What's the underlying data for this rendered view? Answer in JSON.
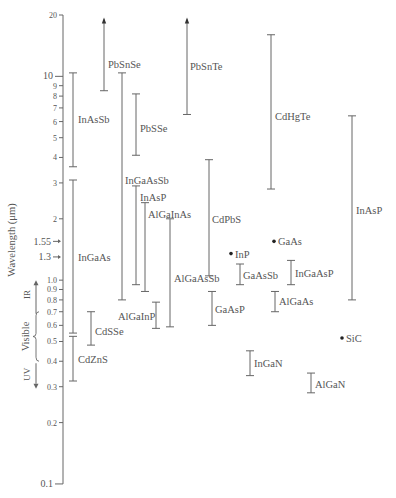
{
  "chart_data": {
    "type": "range",
    "title": "",
    "ylabel": "Wavelength (μm)",
    "yscale": "log",
    "ylim": [
      0.1,
      20
    ],
    "yticks": [
      {
        "v": 20,
        "label": "20",
        "big": false
      },
      {
        "v": 10,
        "label": "10",
        "big": true
      },
      {
        "v": 9,
        "label": "9"
      },
      {
        "v": 8,
        "label": "8"
      },
      {
        "v": 7,
        "label": "7"
      },
      {
        "v": 6,
        "label": "6"
      },
      {
        "v": 5,
        "label": "5"
      },
      {
        "v": 4,
        "label": "4"
      },
      {
        "v": 3,
        "label": "3"
      },
      {
        "v": 2,
        "label": "2"
      },
      {
        "v": 1.0,
        "label": "1.0"
      },
      {
        "v": 0.9,
        "label": "0.9"
      },
      {
        "v": 0.8,
        "label": "0.8"
      },
      {
        "v": 0.7,
        "label": "0.7"
      },
      {
        "v": 0.6,
        "label": "0.6"
      },
      {
        "v": 0.5,
        "label": "0.5"
      },
      {
        "v": 0.4,
        "label": "0.4"
      },
      {
        "v": 0.3,
        "label": "0.3"
      },
      {
        "v": 0.2,
        "label": "0.2"
      },
      {
        "v": 0.1,
        "label": "0.1",
        "big": true
      }
    ],
    "markers": [
      {
        "v": 1.55,
        "label": "1.55"
      },
      {
        "v": 1.3,
        "label": "1.3"
      }
    ],
    "regions": [
      {
        "name": "IR",
        "from": 0.7,
        "to": 1.0,
        "arrow": "up"
      },
      {
        "name": "Visible",
        "from": 0.4,
        "to": 0.7,
        "brace": true
      },
      {
        "name": "UV",
        "from": 0.3,
        "to": 0.4,
        "arrow": "down"
      }
    ],
    "ranges": [
      {
        "name": "PbSnSe",
        "x": 104,
        "min": 8.5,
        "max": 19,
        "open_top": true,
        "lx": 108,
        "ly": 11.5
      },
      {
        "name": "InAsSb",
        "x": 73,
        "min": 3.6,
        "max": 10.4,
        "lx": 78,
        "ly": 6.2
      },
      {
        "name": "InGaAs",
        "x": 73,
        "min": 0.55,
        "max": 3.1,
        "lx": 78,
        "ly": 1.3
      },
      {
        "name": "CdZnS",
        "x": 73,
        "min": 0.32,
        "max": 0.53,
        "lx": 78,
        "ly": 0.41
      },
      {
        "name": "CdSSe",
        "x": 91,
        "min": 0.48,
        "max": 0.7,
        "lx": 95,
        "ly": 0.56
      },
      {
        "name": "InGaAsSb",
        "x": 122,
        "min": 0.8,
        "max": 10.4,
        "lx": 125,
        "ly": 3.1
      },
      {
        "name": "PbSSe",
        "x": 136,
        "min": 4.1,
        "max": 8.2,
        "lx": 140,
        "ly": 5.6
      },
      {
        "name": "InAsP",
        "x": 136,
        "min": 0.95,
        "max": 2.9,
        "lx": 140,
        "ly": 2.55
      },
      {
        "name": "AlGaInAs",
        "x": 145,
        "min": 0.88,
        "max": 2.4,
        "lx": 148,
        "ly": 2.1
      },
      {
        "name": "AlGaInP",
        "x": 156,
        "min": 0.58,
        "max": 0.78,
        "lx": 118,
        "ly": 0.67
      },
      {
        "name": "AlGaAsSb",
        "x": 170,
        "min": 0.59,
        "max": 2.0,
        "lx": 174,
        "ly": 1.02
      },
      {
        "name": "PbSnTe",
        "x": 187,
        "min": 6.5,
        "max": 19,
        "open_top": true,
        "lx": 190,
        "ly": 11.2
      },
      {
        "name": "CdPbS",
        "x": 209,
        "min": 1.05,
        "max": 3.9,
        "lx": 212,
        "ly": 2.0
      },
      {
        "name": "GaAsP",
        "x": 212,
        "min": 0.6,
        "max": 0.88,
        "lx": 215,
        "ly": 0.72
      },
      {
        "name": "InP",
        "x": 231,
        "min": 1.35,
        "max": 1.35,
        "dot": true,
        "lx": 235,
        "ly": 1.35
      },
      {
        "name": "GaAsSb",
        "x": 240,
        "min": 0.95,
        "max": 1.2,
        "lx": 243,
        "ly": 1.06
      },
      {
        "name": "GaAs",
        "x": 274,
        "min": 1.55,
        "max": 1.55,
        "dot": true,
        "lx": 278,
        "ly": 1.55
      },
      {
        "name": "CdHgTe",
        "x": 271,
        "min": 2.8,
        "max": 16,
        "lx": 275,
        "ly": 6.4
      },
      {
        "name": "InGaAsP",
        "x": 291,
        "min": 0.95,
        "max": 1.25,
        "lx": 295,
        "ly": 1.09
      },
      {
        "name": "AlGaAs",
        "x": 275,
        "min": 0.7,
        "max": 0.88,
        "lx": 279,
        "ly": 0.79
      },
      {
        "name": "InAsP",
        "x": 352,
        "min": 0.8,
        "max": 6.4,
        "lx": 356,
        "ly": 2.2
      },
      {
        "name": "InGaN",
        "x": 250,
        "min": 0.34,
        "max": 0.45,
        "lx": 254,
        "ly": 0.39
      },
      {
        "name": "AlGaN",
        "x": 311,
        "min": 0.28,
        "max": 0.35,
        "lx": 315,
        "ly": 0.31
      },
      {
        "name": "SiC",
        "x": 342,
        "min": 0.52,
        "max": 0.52,
        "dot": true,
        "lx": 346,
        "ly": 0.52
      }
    ]
  }
}
